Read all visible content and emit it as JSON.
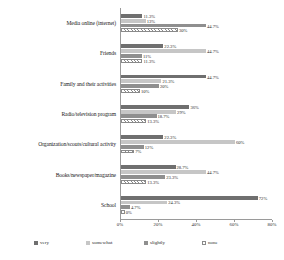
{
  "chart_data": {
    "type": "bar",
    "orientation": "horizontal",
    "title": "",
    "xlabel": "",
    "ylabel": "",
    "xlim": [
      0,
      80
    ],
    "xticks": [
      "0%",
      "20%",
      "40%",
      "60%",
      "80%"
    ],
    "xtick_values": [
      0,
      20,
      40,
      60,
      80
    ],
    "grid": false,
    "legend_position": "bottom",
    "categories": [
      "Media online (internet)",
      "Friends",
      "Family and their activities",
      "Radio/television program",
      "Organization/scouts/cultural activity",
      "Books/newspaper/magazine",
      "School"
    ],
    "series": [
      {
        "name": "very",
        "color": "#6f6f6f",
        "values": [
          11.3,
          22.3,
          44.7,
          36.0,
          22.3,
          28.7,
          72.0
        ],
        "labels": [
          "11.3%",
          "22.3%",
          "44.7%",
          "36%",
          "22.3%",
          "28.7%",
          "72%"
        ]
      },
      {
        "name": "somewhat",
        "color": "#c6c6c6",
        "values": [
          13.0,
          44.7,
          21.3,
          29.0,
          60.0,
          44.7,
          24.3
        ],
        "labels": [
          "13%",
          "44.7%",
          "21.3%",
          "29%",
          "60%",
          "44.7%",
          "24.3%"
        ]
      },
      {
        "name": "slightly",
        "color": "#8f8f8f",
        "values": [
          44.7,
          11.0,
          20.0,
          18.7,
          12.0,
          23.3,
          4.7
        ],
        "labels": [
          "44.7%",
          "11%",
          "20%",
          "18.7%",
          "12%",
          "23.3%",
          "4.7%"
        ]
      },
      {
        "name": "none",
        "color": "#ffffff",
        "hatch": true,
        "values": [
          30.0,
          11.3,
          10.0,
          13.3,
          7.0,
          13.3,
          2.0
        ],
        "labels": [
          "30%",
          "11.3%",
          "10%",
          "13.3%",
          "7%",
          "13.3%",
          "0%"
        ]
      }
    ]
  },
  "legend": {
    "items": [
      {
        "label": "very"
      },
      {
        "label": "somewhat"
      },
      {
        "label": "slightly"
      },
      {
        "label": "none"
      }
    ]
  }
}
